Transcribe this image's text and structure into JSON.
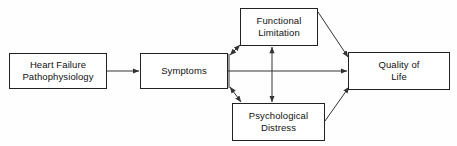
{
  "diagram": {
    "background_color": "#fefefe",
    "line_color": "#333333",
    "box_border_color": "#222222",
    "box_fill_color": "#ffffff",
    "text_color": "#111111",
    "nodes": [
      {
        "id": "heart-failure-pathophysiology",
        "label": "Heart Failure\nPathophysiology",
        "x": 9,
        "y": 53,
        "w": 98,
        "h": 36
      },
      {
        "id": "symptoms",
        "label": "Symptoms",
        "x": 140,
        "y": 53,
        "w": 88,
        "h": 36
      },
      {
        "id": "functional-limitation",
        "label": "Functional\nLimitation",
        "x": 240,
        "y": 8,
        "w": 78,
        "h": 38
      },
      {
        "id": "psychological-distress",
        "label": "Psychological\nDistress",
        "x": 232,
        "y": 103,
        "w": 93,
        "h": 38
      },
      {
        "id": "quality-of-life",
        "label": "Quality of\nLife",
        "x": 348,
        "y": 52,
        "w": 102,
        "h": 38
      }
    ],
    "edges": [
      {
        "id": "edge-pathophysiology-to-symptoms",
        "from": "heart-failure-pathophysiology",
        "to": "symptoms",
        "arrowheads": "end",
        "shape": "horizontal"
      },
      {
        "id": "edge-symptoms-to-functional-limitation",
        "from": "symptoms",
        "to": "functional-limitation",
        "arrowheads": "both",
        "shape": "diagonal-up"
      },
      {
        "id": "edge-symptoms-to-psychological-distress",
        "from": "symptoms",
        "to": "psychological-distress",
        "arrowheads": "both",
        "shape": "diagonal-down"
      },
      {
        "id": "edge-functional-limitation-to-psychological-distress",
        "from": "functional-limitation",
        "to": "psychological-distress",
        "arrowheads": "both",
        "shape": "vertical"
      },
      {
        "id": "edge-symptoms-to-quality-of-life",
        "from": "symptoms",
        "to": "quality-of-life",
        "arrowheads": "end",
        "shape": "horizontal"
      },
      {
        "id": "edge-functional-limitation-to-quality-of-life",
        "from": "functional-limitation",
        "to": "quality-of-life",
        "arrowheads": "end",
        "shape": "diagonal-down"
      },
      {
        "id": "edge-psychological-distress-to-quality-of-life",
        "from": "psychological-distress",
        "to": "quality-of-life",
        "arrowheads": "end",
        "shape": "diagonal-up"
      }
    ]
  }
}
